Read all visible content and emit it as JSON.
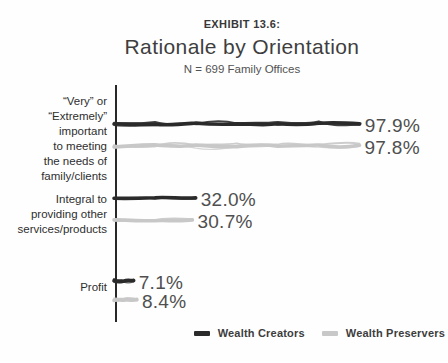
{
  "header": {
    "exhibit": "EXHIBIT 13.6:",
    "title": "Rationale by Orientation",
    "subtitle": "N = 699 Family Offices"
  },
  "legend": {
    "items": [
      {
        "label": "Wealth Creators",
        "color": "#2b2b2b"
      },
      {
        "label": "Wealth Preservers",
        "color": "#c8c8c8"
      }
    ]
  },
  "chart_data": {
    "type": "bar",
    "orientation": "horizontal",
    "style": "hand-drawn-sketch",
    "exhibit_label": "EXHIBIT 13.6:",
    "title": "Rationale by Orientation",
    "subtitle": "N = 699 Family Offices",
    "categories": [
      "“Very” or\n“Extremely”\nimportant\nto meeting\nthe needs of\nfamily/clients",
      "Integral to\nproviding other\nservices/products",
      "Profit"
    ],
    "series": [
      {
        "name": "Wealth Creators",
        "color": "#2b2b2b",
        "values": [
          97.9,
          32.0,
          7.1
        ],
        "labels": [
          "97.9%",
          "32.0%",
          "7.1%"
        ]
      },
      {
        "name": "Wealth Preservers",
        "color": "#c8c8c8",
        "values": [
          97.8,
          30.7,
          8.4
        ],
        "labels": [
          "97.8%",
          "30.7%",
          "8.4%"
        ]
      }
    ],
    "xlim": [
      0,
      100
    ],
    "axis_color": "#282828",
    "value_label_color": "#4f4f4f",
    "grid": false,
    "legend_position": "bottom-right"
  }
}
